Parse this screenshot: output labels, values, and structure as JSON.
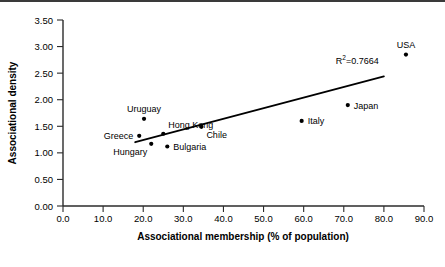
{
  "chart_data": {
    "type": "scatter",
    "title": "",
    "xlabel": "Associational membership (% of population)",
    "ylabel": "Associational density",
    "xlim": [
      0.0,
      90.0
    ],
    "ylim": [
      0.0,
      3.5
    ],
    "xticks": [
      "0.0",
      "10.0",
      "20.0",
      "30.0",
      "40.0",
      "50.0",
      "60.0",
      "70.0",
      "80.0",
      "90.0"
    ],
    "yticks": [
      "0.00",
      "0.50",
      "1.00",
      "1.50",
      "2.00",
      "2.50",
      "3.00",
      "3.50"
    ],
    "grid": false,
    "legend": "none",
    "points": [
      {
        "label": "Greece",
        "x": 19.0,
        "y": 1.32,
        "label_pos": "left"
      },
      {
        "label": "Uruguay",
        "x": 20.2,
        "y": 1.64,
        "label_pos": "above"
      },
      {
        "label": "Hungary",
        "x": 22.0,
        "y": 1.17,
        "label_pos": "below-left"
      },
      {
        "label": "Hong Kong",
        "x": 25.0,
        "y": 1.36,
        "label_pos": "above-right"
      },
      {
        "label": "Bulgaria",
        "x": 26.0,
        "y": 1.12,
        "label_pos": "right"
      },
      {
        "label": "Chile",
        "x": 34.5,
        "y": 1.49,
        "label_pos": "below-right"
      },
      {
        "label": "Italy",
        "x": 59.5,
        "y": 1.6,
        "label_pos": "right"
      },
      {
        "label": "Japan",
        "x": 71.0,
        "y": 1.9,
        "label_pos": "right"
      },
      {
        "label": "USA",
        "x": 85.5,
        "y": 2.85,
        "label_pos": "above"
      }
    ],
    "trendline": {
      "x_start": 18.0,
      "y_start": 1.2,
      "x_end": 80.0,
      "y_end": 2.44
    },
    "annotations": [
      {
        "text_prefix": "R",
        "text_sup": "2",
        "text_suffix": "=0.7664",
        "full": "R2=0.7664",
        "x": 68.0,
        "y": 2.67
      }
    ]
  }
}
